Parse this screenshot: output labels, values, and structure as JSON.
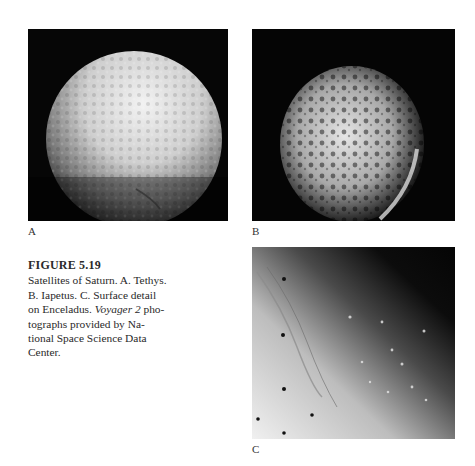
{
  "figure": {
    "number": "FIGURE 5.19",
    "caption_parts": {
      "line1": "Satellites of Saturn. A. Tethys.",
      "line2": "B. Iapetus. C. Surface detail",
      "line3_pre": "on Enceladus. ",
      "line3_italic": "Voyager 2",
      "line3_post": " pho-",
      "line4": "tographs provided by Na-",
      "line5": "tional Space Science Data",
      "line6": "Center."
    },
    "panels": [
      {
        "label": "A",
        "subject": "Tethys"
      },
      {
        "label": "B",
        "subject": "Iapetus"
      },
      {
        "label": "C",
        "subject": "Surface detail on Enceladus"
      }
    ]
  }
}
